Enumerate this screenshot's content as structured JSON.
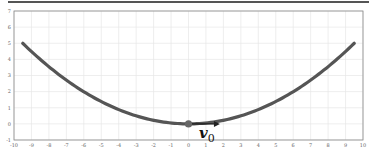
{
  "chart_data": {
    "type": "line",
    "title": "",
    "xlabel": "",
    "ylabel": "",
    "xlim": [
      -10,
      10
    ],
    "ylim": [
      -1,
      7
    ],
    "grid": true,
    "x_ticks": [
      "-10",
      "-9",
      "-8",
      "-7",
      "-6",
      "-5",
      "-4",
      "-3",
      "-2",
      "-1",
      "0",
      "1",
      "2",
      "3",
      "4",
      "5",
      "6",
      "7",
      "8",
      "9",
      "10"
    ],
    "y_ticks": [
      "-1",
      "0",
      "1",
      "2",
      "3",
      "4",
      "5",
      "6",
      "7"
    ],
    "series": [
      {
        "name": "parabola",
        "function": "y = 0.0554 * x^2",
        "x_range": [
          -9.5,
          9.5
        ],
        "color": "#555555"
      }
    ],
    "point": {
      "name": "origin-point",
      "x": 0,
      "y": 0,
      "color": "#666666"
    },
    "vector": {
      "name": "v0",
      "from": [
        0,
        0
      ],
      "to": [
        1.8,
        0
      ],
      "color": "#222222"
    },
    "annotation": {
      "text": "v",
      "subscript": "0",
      "x": 0.6,
      "y": -0.6
    }
  }
}
